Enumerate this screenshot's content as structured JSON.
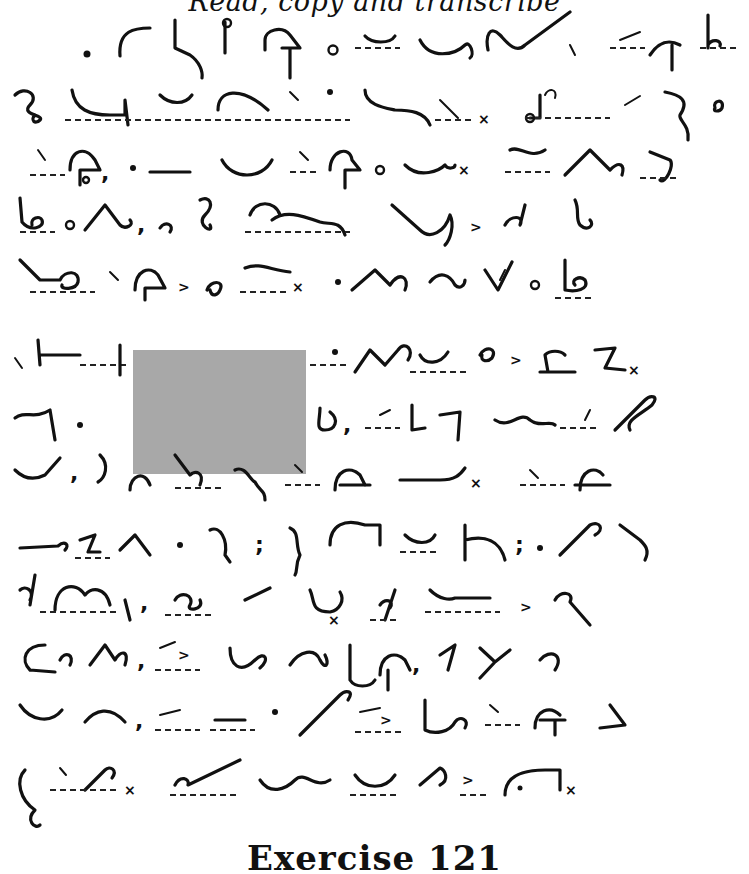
{
  "header": {
    "title": "Read, copy and transcribe"
  },
  "footer": {
    "label": "Exercise 121"
  },
  "redaction": {
    "x": 133,
    "y": 350,
    "width": 173,
    "height": 124,
    "color": "#a8a8a8"
  },
  "content": {
    "type": "Pitman shorthand passage",
    "line_count": 13,
    "marks": {
      "period": "x",
      "separator": ">"
    }
  }
}
